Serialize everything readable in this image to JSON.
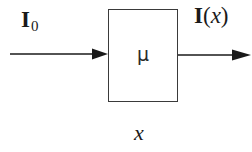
{
  "diagram": {
    "type": "block-diagram",
    "block": {
      "symbol": "μ",
      "description": "attenuation medium"
    },
    "input": {
      "label_main": "I",
      "label_sub": "0"
    },
    "output": {
      "label_main": "I",
      "label_open": "(",
      "label_var": "x",
      "label_close": ")"
    },
    "axis": {
      "label": "x"
    },
    "colors": {
      "stroke": "#1a1a1a",
      "background": "#ffffff"
    }
  }
}
